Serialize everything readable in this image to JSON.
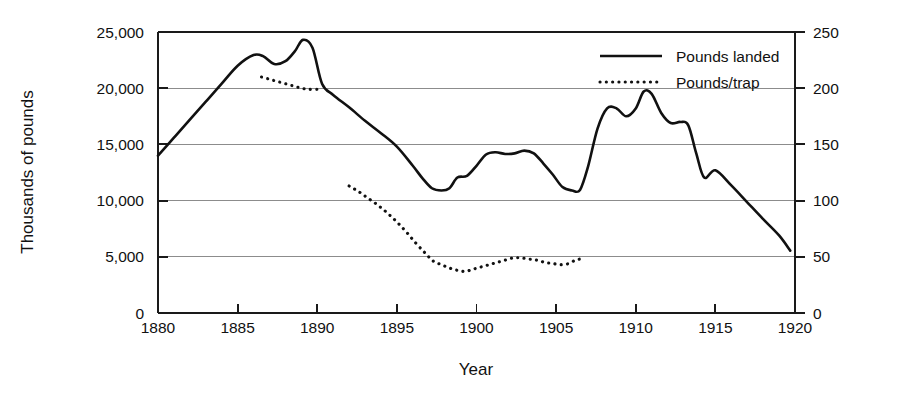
{
  "chart_data": {
    "type": "line",
    "title": "",
    "xlabel": "Year",
    "ylabel": "Thousands of pounds",
    "ylabel_right": "",
    "xlim": [
      1880,
      1920
    ],
    "ylim": [
      0,
      25000
    ],
    "ylim_right": [
      0,
      250
    ],
    "grid": true,
    "legend_position": "top-right",
    "xticks": [
      "1880",
      "1885",
      "1890",
      "1895",
      "1900",
      "1905",
      "1910",
      "1915",
      "1920"
    ],
    "xtick_values": [
      1880,
      1885,
      1890,
      1895,
      1900,
      1905,
      1910,
      1915,
      1920
    ],
    "yticks": [
      "0",
      "5,000",
      "10,000",
      "15,000",
      "20,000",
      "25,000"
    ],
    "ytick_values": [
      0,
      5000,
      10000,
      15000,
      20000,
      25000
    ],
    "yticks_right": [
      "0",
      "50",
      "100",
      "150",
      "200",
      "250"
    ],
    "ytick_values_right": [
      0,
      50,
      100,
      150,
      200,
      250
    ],
    "series": [
      {
        "name": "Pounds landed",
        "axis": "left",
        "style": "solid",
        "x": [
          1880,
          1881,
          1882,
          1883,
          1884,
          1885,
          1886,
          1886.6,
          1887.3,
          1888,
          1888.6,
          1889.1,
          1889.7,
          1890.3,
          1891,
          1892,
          1893,
          1894,
          1895,
          1896,
          1896.6,
          1897.2,
          1897.8,
          1898.3,
          1898.8,
          1899.4,
          1900,
          1900.6,
          1901.2,
          1901.8,
          1902.4,
          1903,
          1903.6,
          1904.2,
          1904.8,
          1905.4,
          1906,
          1906.5,
          1907,
          1907.6,
          1908.2,
          1908.8,
          1909.4,
          1910,
          1910.5,
          1911,
          1911.6,
          1912.2,
          1912.8,
          1913.3,
          1913.8,
          1914.3,
          1915,
          1916,
          1917,
          1918,
          1919,
          1919.7
        ],
        "y": [
          14000,
          15600,
          17200,
          18800,
          20400,
          22000,
          22950,
          22850,
          22150,
          22400,
          23300,
          24300,
          23600,
          20400,
          19400,
          18300,
          17100,
          16000,
          14800,
          13100,
          12000,
          11100,
          10900,
          11100,
          12050,
          12200,
          13100,
          14100,
          14300,
          14150,
          14200,
          14450,
          14200,
          13300,
          12300,
          11200,
          10900,
          10950,
          13000,
          16400,
          18200,
          18200,
          17500,
          18200,
          19700,
          19500,
          17800,
          16900,
          17000,
          16700,
          14200,
          12050,
          12700,
          11350,
          9850,
          8350,
          6900,
          5550
        ]
      },
      {
        "name": "Pounds/trap",
        "axis": "right",
        "style": "dotted",
        "segments": [
          {
            "x": [
              1886.5,
              1887.0,
              1887.5,
              1888.0,
              1888.5,
              1889.0,
              1889.5,
              1890.0
            ],
            "y": [
              210,
              208,
              206,
              204,
              202,
              200,
              199,
              199
            ]
          },
          {
            "x": [
              1892.0,
              1892.6,
              1893.2,
              1893.8,
              1894.4,
              1895.0,
              1895.6,
              1896.2,
              1896.8,
              1897.3,
              1897.8,
              1898.3,
              1898.8,
              1899.3,
              1899.8,
              1900.3,
              1900.8,
              1901.3,
              1901.8,
              1902.3,
              1902.8,
              1903.3,
              1903.8,
              1904.3,
              1904.8,
              1905.3,
              1905.8,
              1906.2,
              1906.5
            ],
            "y": [
              113,
              108,
              102,
              96,
              89,
              81,
              72,
              62,
              53,
              46,
              43,
              40,
              38,
              37,
              39,
              41,
              43,
              45,
              47,
              49,
              49,
              48,
              47,
              45,
              44,
              43,
              44,
              47,
              48
            ]
          }
        ]
      }
    ]
  },
  "legend": {
    "items": [
      {
        "label": "Pounds landed",
        "style": "solid"
      },
      {
        "label": "Pounds/trap",
        "style": "dotted"
      }
    ]
  },
  "colors": {
    "line": "#111111",
    "grid": "#8c8c8c",
    "axis": "#1a1a1a",
    "background": "#ffffff"
  }
}
